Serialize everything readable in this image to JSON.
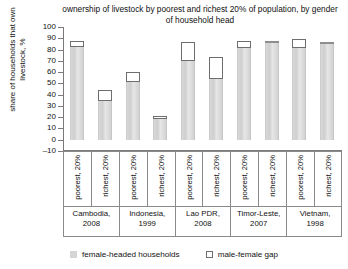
{
  "chart_data": {
    "type": "bar",
    "title": "ownership of livestock by poorest and richest 20% of population, by gender of household head",
    "xlabel": "",
    "ylabel": "share of households that own livestock, %",
    "ylim": [
      -10,
      100
    ],
    "ytick_labels": [
      "100",
      "90",
      "80",
      "70",
      "60",
      "50",
      "40",
      "30",
      "20",
      "10",
      "0",
      "–10"
    ],
    "ytick_values": [
      100,
      90,
      80,
      70,
      60,
      50,
      40,
      30,
      20,
      10,
      0,
      -10
    ],
    "grid": false,
    "legend_position": "bottom",
    "categories": [
      "poorest, 20%",
      "richest, 20%",
      "poorest, 20%",
      "richest, 20%",
      "poorest, 20%",
      "richest, 20%",
      "poorest, 20%",
      "richest, 20%",
      "poorest, 20%",
      "richest, 20%"
    ],
    "groups": [
      {
        "country": "Cambodia,",
        "year": "2008"
      },
      {
        "country": "Indonesia,",
        "year": "1999"
      },
      {
        "country": "Lao PDR,",
        "year": "2008"
      },
      {
        "country": "Timor-Leste,",
        "year": "2007"
      },
      {
        "country": "Vietnam,",
        "year": "1998"
      }
    ],
    "series": [
      {
        "name": "female-headed households",
        "color": "#d5d5d5",
        "values": [
          82,
          34,
          51,
          18,
          70,
          54,
          81,
          86,
          81,
          85
        ]
      },
      {
        "name": "male-female gap",
        "color": "#ffffff",
        "values": [
          6,
          10,
          9,
          3,
          17,
          19,
          7,
          0,
          8,
          0
        ]
      }
    ],
    "bar_tops": [
      88,
      44,
      60,
      21,
      87,
      73,
      88,
      86,
      89,
      85
    ]
  },
  "legend": {
    "items": [
      {
        "label": "female-headed households",
        "marker": "filled-square"
      },
      {
        "label": "male-female gap",
        "marker": "outline-square"
      }
    ]
  }
}
